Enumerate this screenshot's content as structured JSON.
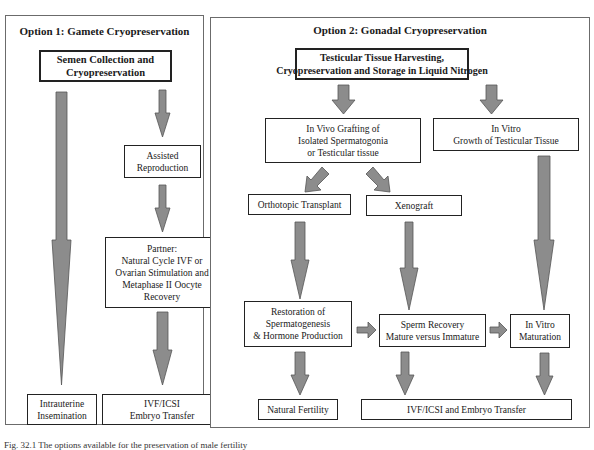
{
  "colors": {
    "arrow_fill": "#8c8c8c",
    "arrow_stroke": "#555555",
    "box_border": "#222222",
    "panel_border": "#6b6b6b"
  },
  "option1": {
    "title": "Option 1: Gamete Cryopreservation",
    "semen_box": [
      "Semen Collection and",
      "Cryopreservation"
    ],
    "assisted_box": [
      "Assisted",
      "Reproduction"
    ],
    "partner_box": [
      "Partner:",
      "Natural Cycle IVF or",
      "Ovarian Stimulation and",
      "Metaphase II Oocyte",
      "Recovery"
    ],
    "intrauterine_box": [
      "Intrauterine",
      "Insemination"
    ],
    "ivf_box": [
      "IVF/ICSI",
      "Embryo Transfer"
    ]
  },
  "option2": {
    "title": "Option 2: Gonadal Cryopreservation",
    "harvest_box": [
      "Testicular  Tissue  Harvesting,",
      "Cryopreservation and Storage in Liquid Nitrogen"
    ],
    "invivo_box": [
      "In Vivo Grafting of",
      "Isolated Spermatogonia",
      "or Testicular tissue"
    ],
    "invitro_box": [
      "In Vitro",
      "Growth of Testicular Tissue"
    ],
    "orthotopic_box": [
      "Orthotopic Transplant"
    ],
    "xenograft_box": [
      "Xenograft"
    ],
    "restoration_box": [
      "Restoration of",
      "Spermatogenesis",
      "& Hormone Production"
    ],
    "sperm_box": [
      "Sperm Recovery",
      "Mature versus Immature"
    ],
    "maturation_box": [
      "In Vitro",
      "Maturation"
    ],
    "natural_box": [
      "Natural Fertility"
    ],
    "ivf_box": [
      "IVF/ICSI  and Embryo Transfer"
    ]
  },
  "caption": "Fig. 32.1  The options available for the preservation of male fertility"
}
